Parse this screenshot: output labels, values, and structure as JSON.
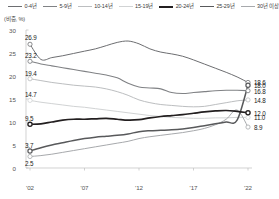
{
  "subtitle": "(비중, %)",
  "legend": {
    "items": [
      {
        "label": "0-4년",
        "color": "#6d6e71",
        "width": 1.0
      },
      {
        "label": "5-9년",
        "color": "#808285",
        "width": 1.1
      },
      {
        "label": "10-14년",
        "color": "#bcbec0",
        "width": 1.0
      },
      {
        "label": "15-19년",
        "color": "#d1d3d4",
        "width": 1.0
      },
      {
        "label": "20-24년",
        "color": "#231f20",
        "width": 1.7
      },
      {
        "label": "25-29년",
        "color": "#58595b",
        "width": 1.5
      },
      {
        "label": "30년 이상",
        "color": "#a7a9ac",
        "width": 1.0
      }
    ]
  },
  "axes": {
    "y_ticks": [
      "0",
      "5",
      "10",
      "15",
      "20",
      "25",
      "30"
    ],
    "y_values": [
      0,
      5,
      10,
      15,
      20,
      25,
      30
    ],
    "x_ticks": [
      "'02",
      "'07",
      "'12",
      "'17",
      "'22"
    ],
    "x_values": [
      2002,
      2007,
      2012,
      2017,
      2022
    ],
    "ylim": [
      0,
      30
    ],
    "xlim": [
      2002,
      2022
    ],
    "grid": false
  },
  "start_labels": [
    "26.9",
    "23.2",
    "19.4",
    "14.7",
    "9.5",
    "3.7",
    "2.5"
  ],
  "end_labels": [
    "18.6",
    "18.0",
    "16.8",
    "14.8",
    "12.0",
    "11.0",
    "8.9"
  ],
  "chart_data": {
    "type": "line",
    "title": "",
    "subtitle": "(비중, %)",
    "xlabel": "",
    "ylabel": "",
    "xlim": [
      2002,
      2022
    ],
    "ylim": [
      0,
      30
    ],
    "grid": false,
    "legend_position": "top",
    "x": [
      2002,
      2003,
      2004,
      2005,
      2006,
      2007,
      2008,
      2009,
      2010,
      2011,
      2012,
      2013,
      2014,
      2015,
      2016,
      2017,
      2018,
      2019,
      2020,
      2021,
      2022
    ],
    "series": [
      {
        "name": "0-4년",
        "color": "#6d6e71",
        "start_label": "26.9",
        "end_label": "18.6",
        "values": [
          26.9,
          23.6,
          24.0,
          24.4,
          24.9,
          25.4,
          25.9,
          26.6,
          27.3,
          27.6,
          27.0,
          25.9,
          25.2,
          24.8,
          24.3,
          23.5,
          22.6,
          21.7,
          20.8,
          19.8,
          18.6
        ]
      },
      {
        "name": "5-9년",
        "color": "#808285",
        "start_label": "23.2",
        "end_label": "16.8",
        "values": [
          23.2,
          22.6,
          22.2,
          21.8,
          21.4,
          21.0,
          20.6,
          20.2,
          19.6,
          18.4,
          17.6,
          17.4,
          17.2,
          16.4,
          16.2,
          16.4,
          16.6,
          16.8,
          16.9,
          16.9,
          16.8
        ]
      },
      {
        "name": "10-14년",
        "color": "#bcbec0",
        "start_label": "19.4",
        "end_label": "14.8",
        "values": [
          19.4,
          19.0,
          18.6,
          18.3,
          18.0,
          17.8,
          17.6,
          17.2,
          16.6,
          15.8,
          14.8,
          14.2,
          13.8,
          13.6,
          13.4,
          13.3,
          13.4,
          13.8,
          14.2,
          14.6,
          14.8
        ]
      },
      {
        "name": "15-19년",
        "color": "#d1d3d4",
        "start_label": "14.7",
        "end_label": "11.0",
        "values": [
          14.7,
          14.3,
          14.0,
          13.7,
          13.4,
          13.2,
          12.9,
          12.6,
          12.3,
          12.0,
          11.7,
          11.4,
          11.2,
          11.0,
          10.9,
          10.8,
          10.8,
          10.9,
          10.9,
          11.0,
          11.0
        ]
      },
      {
        "name": "20-24년",
        "color": "#231f20",
        "start_label": "9.5",
        "end_label": "12.0",
        "values": [
          9.5,
          9.6,
          10.0,
          10.4,
          10.6,
          10.6,
          10.7,
          10.8,
          10.6,
          10.4,
          10.5,
          10.9,
          11.2,
          11.4,
          11.6,
          11.9,
          12.2,
          12.4,
          12.5,
          12.3,
          12.0
        ]
      },
      {
        "name": "25-29년",
        "color": "#58595b",
        "start_label": "3.7",
        "end_label": "18.0",
        "values": [
          3.7,
          4.4,
          5.0,
          5.5,
          6.0,
          6.4,
          6.7,
          6.9,
          7.1,
          7.4,
          7.9,
          8.1,
          8.2,
          8.3,
          8.5,
          8.8,
          9.2,
          9.6,
          10.0,
          10.4,
          18.0
        ]
      },
      {
        "name": "30년 이상",
        "color": "#a7a9ac",
        "start_label": "2.5",
        "end_label": "8.9",
        "values": [
          2.5,
          2.7,
          3.0,
          3.4,
          3.8,
          4.2,
          4.6,
          5.0,
          5.4,
          5.8,
          6.4,
          6.8,
          7.1,
          7.4,
          7.7,
          8.1,
          8.6,
          9.4,
          10.6,
          12.6,
          8.9
        ]
      }
    ]
  }
}
